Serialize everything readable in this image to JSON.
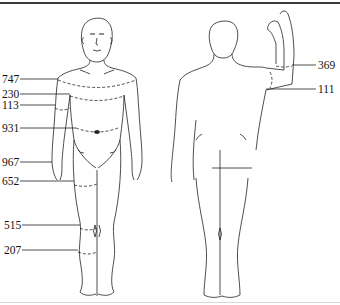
{
  "figure": {
    "views": [
      "front-view",
      "back-view"
    ]
  },
  "front_labels": [
    {
      "id": "chest",
      "text": "747",
      "y": 79
    },
    {
      "id": "under-chest",
      "text": "230",
      "y": 94
    },
    {
      "id": "upper-arm",
      "text": "113",
      "y": 105
    },
    {
      "id": "waist",
      "text": "931",
      "y": 128
    },
    {
      "id": "wrist",
      "text": "967",
      "y": 162
    },
    {
      "id": "thigh",
      "text": "652",
      "y": 181
    },
    {
      "id": "knee",
      "text": "515",
      "y": 225
    },
    {
      "id": "calf",
      "text": "207",
      "y": 250
    }
  ],
  "back_labels": [
    {
      "id": "forearm",
      "text": "369",
      "y": 65
    },
    {
      "id": "elbow",
      "text": "111",
      "y": 89
    }
  ],
  "colors": {
    "line": "#222222",
    "border": "#3a3a3a",
    "background": "#ffffff"
  }
}
